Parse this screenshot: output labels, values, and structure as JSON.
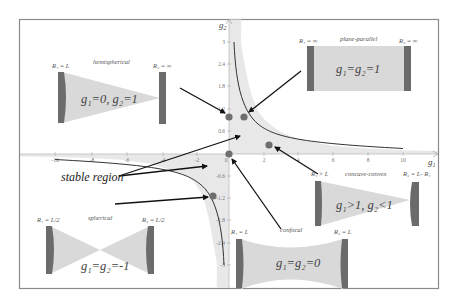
{
  "figure": {
    "axes": {
      "x_label": "g",
      "x_label_sub": "1",
      "y_label": "g",
      "y_label_sub": "2",
      "x_ticks": [
        "-10",
        "-8",
        "-6",
        "-4",
        "-2",
        "0",
        "2",
        "4",
        "6",
        "8",
        "10"
      ],
      "y_ticks": [
        "3",
        "2.4",
        "1.8",
        "1.2",
        "0.6",
        "0",
        "-0.6",
        "-1.2",
        "-1.8",
        "-2.4",
        "-3"
      ]
    },
    "region_label": "stable region",
    "curve": "g1·g2 = 1",
    "colors": {
      "frame": "#8a8a8a",
      "shade": "#e6e6e6",
      "mirror": "#6b6b6b",
      "beam": "#d9d9d9",
      "point": "#6e6e6e",
      "arrow": "#111111",
      "curve": "#333333"
    },
    "resonators": [
      {
        "name": "hemispherical",
        "r1": "R₁ = L",
        "r2": "R₂ = ∞",
        "equation": "g₁=0, g₂=1",
        "point": {
          "g1": 0,
          "g2": 1
        }
      },
      {
        "name": "plane-parallel",
        "r1": "R₁ = ∞",
        "r2": "R₂ = ∞",
        "equation": "g₁=g₂=1",
        "point": {
          "g1": 1,
          "g2": 1
        }
      },
      {
        "name": "concave-convex",
        "r1": "R₁ > L",
        "r2": "R₂ = L- R₁",
        "equation": "g₁>1, g₂<1",
        "point": {
          "g1": 2.35,
          "g2": 0.3
        }
      },
      {
        "name": "confocal",
        "r1": "R₁ = L",
        "r2": "R₂ = L",
        "equation": "g₁=g₂=0",
        "point": {
          "g1": 0,
          "g2": 0
        }
      },
      {
        "name": "spherical",
        "r1": "R₁ = L/2",
        "r2": "R₂ = L/2",
        "equation": "g₁=g₂=-1",
        "point": {
          "g1": -1,
          "g2": -1
        }
      }
    ]
  }
}
